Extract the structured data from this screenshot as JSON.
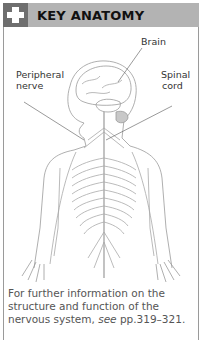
{
  "header": {
    "icon": "medical-cross-icon",
    "title": "KEY ANATOMY"
  },
  "figure": {
    "labels": {
      "brain": "Brain",
      "peripheral_line1": "Peripheral",
      "peripheral_line2": "nerve",
      "spinal_line1": "Spinal",
      "spinal_line2": "cord"
    }
  },
  "caption": {
    "text_before": "For further information on the structure and function of the nervous system, ",
    "see": "see",
    "text_after": " pp.319–321."
  },
  "colors": {
    "header_bg": "#b3b3b3",
    "icon_bg": "#6e6e6e",
    "line": "#9a9a9a"
  }
}
